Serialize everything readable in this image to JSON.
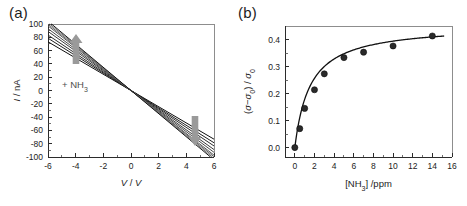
{
  "figure": {
    "panel_a_label": "(a)",
    "panel_b_label": "(b)"
  },
  "chart_data": [
    {
      "panel": "(a)",
      "type": "line",
      "title": "",
      "xlabel": "V / V",
      "ylabel": "I / nA",
      "xlim": [
        -6,
        6
      ],
      "ylim": [
        -100,
        100
      ],
      "xticks": [
        -6,
        -4,
        -2,
        0,
        2,
        4,
        6
      ],
      "xticklabels": [
        "-6",
        "-4",
        "-2",
        "0",
        "2",
        "4",
        "6"
      ],
      "yticks": [
        -100,
        -80,
        -60,
        -40,
        -20,
        0,
        20,
        40,
        60,
        80,
        100
      ],
      "yticklabels": [
        "-100",
        "-80",
        "-60",
        "-40",
        "-20",
        "0",
        "20",
        "40",
        "60",
        "80",
        "100"
      ],
      "grid": false,
      "legend": "none",
      "annotation": "+ NH3",
      "annotation_display": "+ NH₃",
      "arrow_up_label": "increasing-concentration-arrow-left",
      "arrow_down_label": "increasing-concentration-arrow-right",
      "series_note": "Ohmic I-V sweeps with negative slope; slope magnitude increases with NH3 exposure",
      "series": [
        {
          "name": "0 ppm",
          "slope_nA_per_V": -12.2,
          "color": "#0f0f0f"
        },
        {
          "name": "0.5 ppm",
          "slope_nA_per_V": -13.1,
          "color": "#1d1d1d"
        },
        {
          "name": "1 ppm",
          "slope_nA_per_V": -13.9,
          "color": "#2b2b2b"
        },
        {
          "name": "2 ppm",
          "slope_nA_per_V": -14.8,
          "color": "#3a3a3a"
        },
        {
          "name": "3 ppm",
          "slope_nA_per_V": -15.5,
          "color": "#484848"
        },
        {
          "name": "5 ppm",
          "slope_nA_per_V": -16.2,
          "color": "#565656"
        },
        {
          "name": "7 ppm",
          "slope_nA_per_V": -16.6,
          "color": "#646464"
        },
        {
          "name": "10 ppm",
          "slope_nA_per_V": -17.0,
          "color": "#727272"
        },
        {
          "name": "14 ppm",
          "slope_nA_per_V": -17.4,
          "color": "#141414"
        }
      ]
    },
    {
      "panel": "(b)",
      "type": "scatter",
      "title": "",
      "xlabel": "[NH3] /ppm",
      "xlabel_display": "[NH₃] /ppm",
      "ylabel": "(sigma - sigma0) / sigma0",
      "ylabel_display": "(σ−σ₀) / σ₀",
      "xlim": [
        -1,
        16
      ],
      "ylim": [
        -0.035,
        0.45
      ],
      "xticks": [
        0,
        2,
        4,
        6,
        8,
        10,
        12,
        14,
        16
      ],
      "xticklabels": [
        "0",
        "2",
        "4",
        "6",
        "8",
        "10",
        "12",
        "14",
        "16"
      ],
      "yticks": [
        0.0,
        0.1,
        0.2,
        0.3,
        0.4
      ],
      "yticklabels": [
        "0.0",
        "0.1",
        "0.2",
        "0.3",
        "0.4"
      ],
      "grid": false,
      "legend": "none",
      "x": [
        0,
        0.5,
        1,
        2,
        3,
        5,
        7,
        10,
        14
      ],
      "values": [
        0.0,
        0.07,
        0.145,
        0.214,
        0.273,
        0.333,
        0.353,
        0.376,
        0.413
      ],
      "fit_note": "Langmuir-type saturation fit through the points"
    }
  ]
}
